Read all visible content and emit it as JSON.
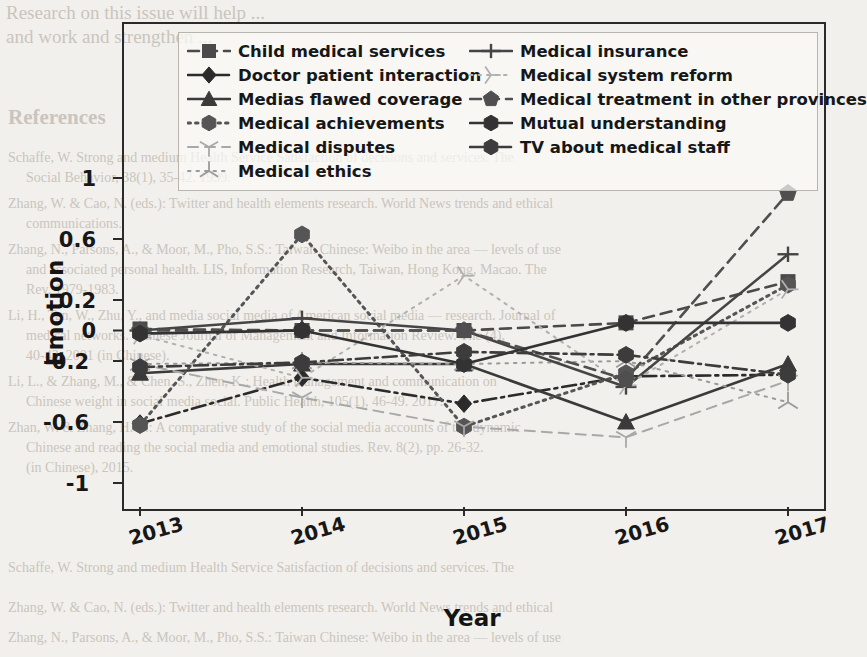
{
  "chart_data": {
    "type": "line",
    "title": "",
    "xlabel": "Year",
    "ylabel": "Emotion",
    "x": [
      "2013",
      "2014",
      "2015",
      "2016",
      "2017"
    ],
    "xticklabels": [
      "2013",
      "2014",
      "2015",
      "2016",
      "2017"
    ],
    "yticklabels": [
      "1",
      "0.6",
      "0.2",
      "0",
      "-0.2",
      "-0.6",
      "-1"
    ],
    "ytickvalues": [
      1,
      0.6,
      0.2,
      0,
      -0.2,
      -0.6,
      -1
    ],
    "ylim": [
      -1,
      1
    ],
    "grid": false,
    "legend_position": "upper-center-inside",
    "legend_columns": 2,
    "series": [
      {
        "name": "Child medical services",
        "marker": "square",
        "linestyle": "dashed",
        "color": "#4a4a4a",
        "values": [
          0.01,
          0.0,
          0.0,
          0.05,
          0.32
        ]
      },
      {
        "name": "Doctor patient interaction",
        "marker": "diamond",
        "linestyle": "dashdot",
        "color": "#2b2b2b",
        "values": [
          -0.61,
          -0.31,
          -0.48,
          -0.3,
          -0.29
        ]
      },
      {
        "name": "Medias flawed coverage",
        "marker": "triangle-up",
        "linestyle": "solid",
        "color": "#3a3a3a",
        "values": [
          -0.28,
          -0.22,
          -0.22,
          -0.6,
          -0.22
        ]
      },
      {
        "name": "Medical achievements",
        "marker": "hexagon",
        "linestyle": "dotted",
        "color": "#555555",
        "values": [
          -0.62,
          0.63,
          -0.63,
          -0.28,
          0.3
        ]
      },
      {
        "name": "Medical disputes",
        "marker": "tri-down",
        "linestyle": "dashed-light",
        "color": "#a8a8a8",
        "values": [
          -0.22,
          -0.44,
          -0.63,
          -0.7,
          -0.33
        ]
      },
      {
        "name": "Medical ethics",
        "marker": "tri-star",
        "linestyle": "dotted-light",
        "color": "#9a9a9a",
        "values": [
          -0.22,
          -0.21,
          -0.22,
          -0.2,
          -0.47
        ]
      },
      {
        "name": "Medical insurance",
        "marker": "plus-bar",
        "linestyle": "solid",
        "color": "#454545",
        "values": [
          0.0,
          0.08,
          0.0,
          -0.37,
          0.5
        ]
      },
      {
        "name": "Medical system reform",
        "marker": "tri-right",
        "linestyle": "dotted-light",
        "color": "#b0b0b0",
        "values": [
          -0.03,
          -0.31,
          0.36,
          -0.36,
          0.27
        ]
      },
      {
        "name": "Medical treatment in other provinces",
        "marker": "pentagon",
        "linestyle": "dashed",
        "color": "#4f4f4f",
        "values": [
          0.0,
          0.0,
          0.0,
          -0.32,
          0.9
        ]
      },
      {
        "name": "Mutual understanding",
        "marker": "hexagon",
        "linestyle": "solid",
        "color": "#333333",
        "values": [
          -0.02,
          0.0,
          -0.22,
          0.05,
          0.05
        ]
      },
      {
        "name": "TV about medical staff",
        "marker": "hexagon",
        "linestyle": "dashdot",
        "color": "#3c3c3c",
        "values": [
          -0.24,
          -0.21,
          -0.14,
          -0.16,
          -0.29
        ]
      }
    ]
  },
  "legend": {
    "column_left": [
      "Child medical services",
      "Doctor patient interaction",
      "Medias flawed coverage",
      "Medical achievements",
      "Medical disputes",
      "Medical ethics"
    ],
    "column_right": [
      "Medical insurance",
      "Medical system reform",
      "Medical treatment in other provinces",
      "Mutual understanding",
      "TV about medical staff"
    ]
  },
  "axes": {
    "ylabel": "Emotion",
    "xlabel": "Year",
    "yticks": [
      "1",
      "0.6",
      "0.2",
      "0",
      "-0.2",
      "-0.6",
      "-1"
    ],
    "xticks": [
      "2013",
      "2014",
      "2015",
      "2016",
      "2017"
    ]
  },
  "background_text": {
    "top_lines": [
      "Research on this issue will help ...",
      "and work and strengthen ..."
    ],
    "section_heading": "References",
    "body_lines": [
      "Schaffe, W. Strong and medium Health Service Satisfaction of decisions and services. The",
      "Social Behavior, 38(1), 35-42. 1999.",
      "Zhang, W. & Cao, N. (eds.): Twitter and health elements research. World News trends and ethical",
      "communications.",
      "Zhang, N., Parsons, A., & Moor, M., Pho, S.S.: Taiwan Chinese: Weibo in the area — levels of use",
      "and associated personal health. LIS, Information Research, Taiwan, Hong Kong, Macao. The",
      "Rev. 1979-1983.",
      "Li, H., Tan, W., Zhu, Y., and media social media of American social media — research. Journal of",
      "medical networks. Chinese Journal of Management and Information Review. The (4),",
      "40-43, 2001 (in Chinese).",
      "Li, L., & Zhang, M., & Chen, S., Zhen, K.: Health management and communication on",
      "Chinese weight in social media social. Public Health, 105(1), 46-49. 2017.",
      "Zhan, W. & Zhang, H. L.: A comparative study of the social media accounts of the dynamic",
      "Chinese and reading the social media and emotional studies. Rev. 8(2), pp. 26-32.",
      "(in Chinese), 2015.",
      "Liu, Q., Chan, F., & Cao, S.: The entity data structure of a unity characters based on the",
      "China health."
    ]
  }
}
